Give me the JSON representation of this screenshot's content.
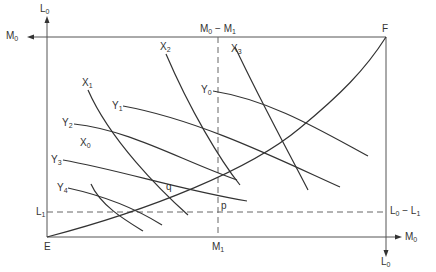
{
  "diagram": {
    "type": "edgeworth-box",
    "colors": {
      "line": "#333333",
      "axis": "#555555",
      "dashed": "#666666"
    },
    "origins": {
      "lower_left": "E",
      "upper_right": "F"
    },
    "axes": {
      "left_top_label": "L0",
      "top_left_label": "M0",
      "top_mid_label": "M0 − M1",
      "bottom_right_label": "M0",
      "bottom_below_label": "L0",
      "right_dashed_label": "L0 − L1",
      "left_dashed_label": "L1",
      "bottom_dashed_label": "M1"
    },
    "points": {
      "q": "q",
      "p": "p"
    },
    "curves_x": [
      "X0",
      "X1",
      "X2",
      "X3"
    ],
    "curves_y": [
      "Y0",
      "Y1",
      "Y2",
      "Y3",
      "Y4"
    ]
  }
}
